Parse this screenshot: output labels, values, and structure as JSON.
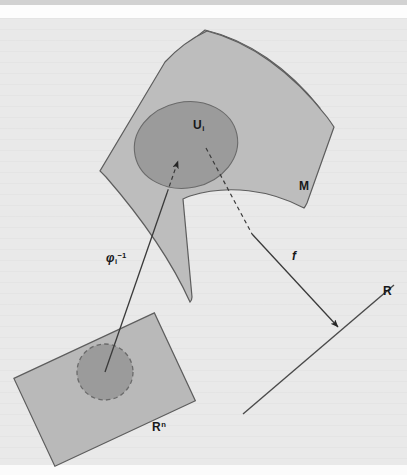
{
  "figure": {
    "background_color": "#e9e9e9",
    "ink_color": "#3a3a3a",
    "text_color": "#17181a"
  },
  "labels": {
    "manifold": "M",
    "neighborhood_base": "U",
    "neighborhood_sub": "i",
    "euclidean_base": "R",
    "euclidean_sup": "n",
    "reals": "R",
    "function": "f",
    "chart_inverse_base": "φ",
    "chart_inverse_sub": "i",
    "chart_inverse_sup": "−1"
  },
  "shapes": {
    "manifold": {
      "name": "M",
      "fill": "#bdbdbd",
      "stroke": "#5d5d5d",
      "description": "curved quadrilateral surface patch"
    },
    "neighborhood": {
      "name": "U_i",
      "fill": "#9b9b9b",
      "stroke": "#6a6a6a",
      "description": "shaded ellipse inside M"
    },
    "euclidean_plane": {
      "name": "R^n",
      "fill": "#b9b9b9",
      "stroke": "#5d5d5d",
      "description": "rotated rectangle lower left"
    },
    "euclidean_disk": {
      "name": "phi_i(U_i)",
      "fill": "#9b9b9b",
      "stroke": "#6a6a6a",
      "stroke_style": "dashed",
      "description": "dashed circle inside R^n"
    },
    "real_line": {
      "name": "R",
      "stroke": "#4a4a4a",
      "description": "diagonal straight line lower right"
    }
  },
  "arrows": [
    {
      "name": "chart-inverse-arrow",
      "label": "φi⁻¹",
      "from": "R^n disk center",
      "to": "U_i",
      "style": "solid-with-dashed-tip",
      "direction": "up-right"
    },
    {
      "name": "function-arrow",
      "label": "f",
      "from": "U_i",
      "to": "R",
      "style": "dashed-then-solid",
      "direction": "down-right"
    }
  ]
}
